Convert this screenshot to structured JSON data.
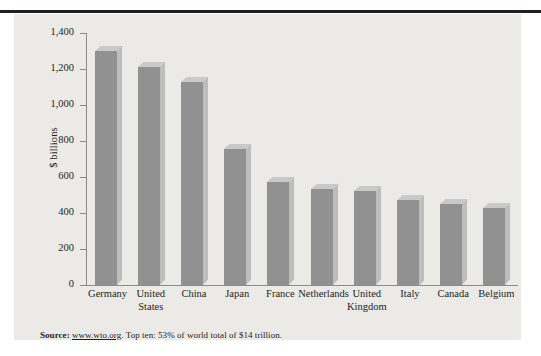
{
  "figure": {
    "panel_color": "#eceae7",
    "rule_color": "#231f20"
  },
  "axis": {
    "ylabel": "$ billions",
    "yticks": [
      "1,400",
      "1,200",
      "1,000",
      "800",
      "600",
      "400",
      "200",
      "0"
    ]
  },
  "source": {
    "label": "Source:",
    "url": "www.wto.org",
    "text": ". Top ten: 53% of world total of $14 trillion."
  },
  "chart_data": {
    "type": "bar",
    "title": "",
    "xlabel": "",
    "ylabel": "$ billions",
    "ylim": [
      0,
      1400
    ],
    "ytick_step": 200,
    "grid": false,
    "legend": "none",
    "bar_color": "#919191",
    "categories": [
      "Germany",
      "United States",
      "China",
      "Japan",
      "France",
      "Netherlands",
      "United Kingdom",
      "Italy",
      "Canada",
      "Belgium"
    ],
    "category_lines": [
      [
        "Germany"
      ],
      [
        "United",
        "States"
      ],
      [
        "China"
      ],
      [
        "Japan"
      ],
      [
        "France"
      ],
      [
        "Netherlands"
      ],
      [
        "United",
        "Kingdom"
      ],
      [
        "Italy"
      ],
      [
        "Canada"
      ],
      [
        "Belgium"
      ]
    ],
    "values": [
      1300,
      1210,
      1130,
      755,
      570,
      535,
      520,
      475,
      450,
      430
    ],
    "annotation": "Source: www.wto.org. Top ten: 53% of world total of $14 trillion."
  }
}
